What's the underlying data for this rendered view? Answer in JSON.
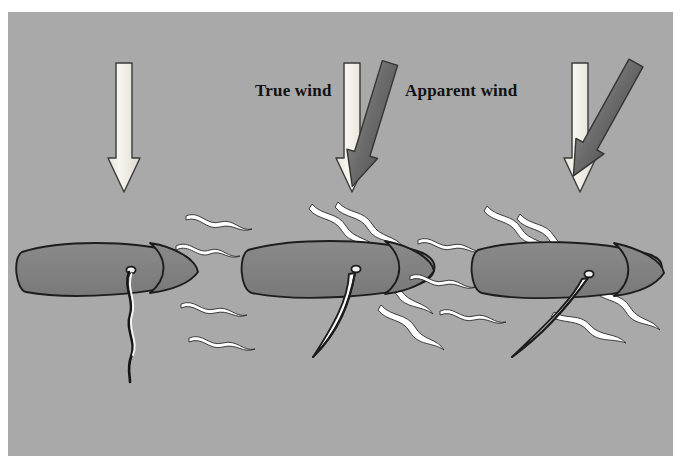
{
  "figure": {
    "type": "diagram",
    "width": 691,
    "height": 474,
    "panel": {
      "x": 8,
      "y": 12,
      "width": 665,
      "height": 444
    }
  },
  "colors": {
    "page_background": "#ffffff",
    "panel_background": "#a9a9a9",
    "hull_fill": "#818181",
    "hull_outline": "#1d1d1d",
    "true_wind_arrow_fill": "#f2f0e8",
    "true_wind_arrow_outline": "#3a3a3a",
    "apparent_wind_arrow_fill": "#6e6e6e",
    "apparent_wind_arrow_outline": "#343434",
    "sail_fill": "#ffffff",
    "sail_outline": "#1d1d1d",
    "streamline_fill": "#ffffff",
    "streamline_outline": "#2a2a2a",
    "label_color": "#121212"
  },
  "labels": {
    "true_wind": "True wind",
    "apparent_wind": "Apparent wind"
  },
  "scenes": [
    {
      "id": "scene-1",
      "name": "head-to-wind",
      "boat": {
        "mast_x": 130,
        "mast_y": 271,
        "hull_center_x": 104,
        "hull_center_y": 276
      },
      "sail": {
        "state": "luffing",
        "angle_deg": 0,
        "description": "sail hangs limp straight down, flapping"
      },
      "true_wind": {
        "angle_deg": 0,
        "present": true,
        "shown": true
      },
      "apparent_wind": {
        "present": false,
        "shown": false
      },
      "streamlines": 0
    },
    {
      "id": "scene-2",
      "name": "close-reach",
      "boat": {
        "mast_x": 355,
        "mast_y": 270,
        "hull_center_x": 330,
        "hull_center_y": 276
      },
      "sail": {
        "state": "drawing",
        "angle_deg": 27,
        "tip_x": 313,
        "tip_y": 356,
        "description": "sail sheeted in, curved crescent"
      },
      "true_wind": {
        "angle_deg": 0,
        "present": true,
        "shown": true
      },
      "apparent_wind": {
        "angle_deg": 17,
        "present": true,
        "shown": true
      },
      "streamlines": 6
    },
    {
      "id": "scene-3",
      "name": "beam-reach",
      "boat": {
        "mast_x": 588,
        "mast_y": 275,
        "hull_center_x": 562,
        "hull_center_y": 278
      },
      "sail": {
        "state": "drawing",
        "angle_deg": 45,
        "tip_x": 512,
        "tip_y": 357,
        "description": "sail eased out further, flatter angle"
      },
      "true_wind": {
        "angle_deg": 0,
        "present": true,
        "shown": true
      },
      "apparent_wind": {
        "angle_deg": 29,
        "present": true,
        "shown": true
      },
      "streamlines": 6
    }
  ],
  "arrows": [
    {
      "id": "arrow-true-1",
      "kind": "true",
      "x": 124,
      "y_top": 63,
      "y_tip": 192,
      "angle_deg": 0
    },
    {
      "id": "arrow-true-2",
      "kind": "true",
      "x": 352,
      "y_top": 63,
      "y_tip": 192,
      "angle_deg": 0
    },
    {
      "id": "arrow-apparent-2",
      "kind": "apparent",
      "x": 390,
      "y_top": 63,
      "y_tip": 192,
      "angle_deg": 17
    },
    {
      "id": "arrow-true-3",
      "kind": "true",
      "x": 580,
      "y_top": 63,
      "y_tip": 192,
      "angle_deg": 0
    },
    {
      "id": "arrow-apparent-3",
      "kind": "apparent",
      "x": 638,
      "y_top": 63,
      "y_tip": 192,
      "angle_deg": 29
    }
  ]
}
